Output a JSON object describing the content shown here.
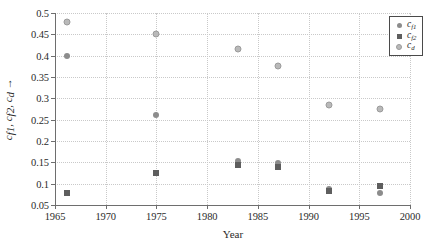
{
  "chart_data": {
    "type": "scatter",
    "title": "",
    "xlabel": "Year",
    "ylabel": "c_f1, c_f2, c_d →",
    "xlim": [
      1965,
      2000
    ],
    "ylim": [
      0.05,
      0.5
    ],
    "xticks": [
      1965,
      1970,
      1975,
      1980,
      1985,
      1990,
      1995,
      2000
    ],
    "yticks": [
      0.05,
      0.1,
      0.15,
      0.2,
      0.25,
      0.3,
      0.35,
      0.4,
      0.45,
      0.5
    ],
    "xtick_labels": [
      "1965",
      "1970",
      "1975",
      "1980",
      "1985",
      "1990",
      "1995",
      "2000"
    ],
    "ytick_labels": [
      "0.05",
      "0.1",
      "0.15",
      "0.2",
      "0.25",
      "0.3",
      "0.35",
      "0.4",
      "0.45",
      "0.5"
    ],
    "grid": true,
    "legend_position": "top-right",
    "series": [
      {
        "name": "c_f1",
        "legend_label_base": "c",
        "legend_label_sub": "f1",
        "marker": "filled-circle",
        "color": "#8c8c8c",
        "points": [
          {
            "x": 1966.2,
            "y": 0.4
          },
          {
            "x": 1975.0,
            "y": 0.26
          },
          {
            "x": 1983.0,
            "y": 0.153
          },
          {
            "x": 1987.0,
            "y": 0.148
          },
          {
            "x": 1992.0,
            "y": 0.088
          },
          {
            "x": 1997.0,
            "y": 0.077
          }
        ]
      },
      {
        "name": "c_f2",
        "legend_label_base": "c",
        "legend_label_sub": "f2",
        "marker": "filled-square",
        "color": "#5e5e5e",
        "points": [
          {
            "x": 1966.2,
            "y": 0.077
          },
          {
            "x": 1975.0,
            "y": 0.125
          },
          {
            "x": 1983.0,
            "y": 0.143
          },
          {
            "x": 1987.0,
            "y": 0.138
          },
          {
            "x": 1992.0,
            "y": 0.082
          },
          {
            "x": 1997.0,
            "y": 0.095
          }
        ]
      },
      {
        "name": "c_d",
        "legend_label_base": "c",
        "legend_label_sub": "d",
        "marker": "open-circle",
        "color": "#b9b9b9",
        "points": [
          {
            "x": 1966.2,
            "y": 0.478
          },
          {
            "x": 1975.0,
            "y": 0.45
          },
          {
            "x": 1983.0,
            "y": 0.415
          },
          {
            "x": 1987.0,
            "y": 0.375
          },
          {
            "x": 1992.0,
            "y": 0.285
          },
          {
            "x": 1997.0,
            "y": 0.275
          }
        ]
      }
    ]
  },
  "axis": {
    "x_title": "Year",
    "y_title_base": "c",
    "y_title_sub1": "f1",
    "y_title_sub2": "f2",
    "y_title_sub3": "d",
    "y_title_arrow": "→"
  }
}
